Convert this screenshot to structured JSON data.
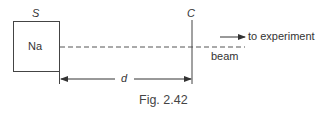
{
  "diagram": {
    "source_label": "S",
    "source_element": "Na",
    "chopper_label": "C",
    "distance_label": "d",
    "beam_label": "beam",
    "direction_label": "to experiment",
    "caption": "Fig. 2.42"
  },
  "colors": {
    "line": "#444444",
    "text": "#333333"
  }
}
